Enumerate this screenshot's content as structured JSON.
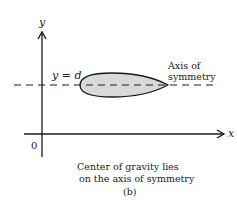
{
  "figure": {
    "axis_labels": {
      "x": "x",
      "y": "y"
    },
    "origin_label": "0",
    "line_label": "y = d",
    "annotation": [
      "Axis of",
      "symmetry"
    ],
    "caption": [
      "Center of gravity lies",
      "on the axis of symmetry"
    ],
    "subfigure_label": "(b)"
  },
  "colors": {
    "stroke": "#1a1a1a",
    "shape_fill": "#d9d9d9",
    "text": "#222222"
  }
}
